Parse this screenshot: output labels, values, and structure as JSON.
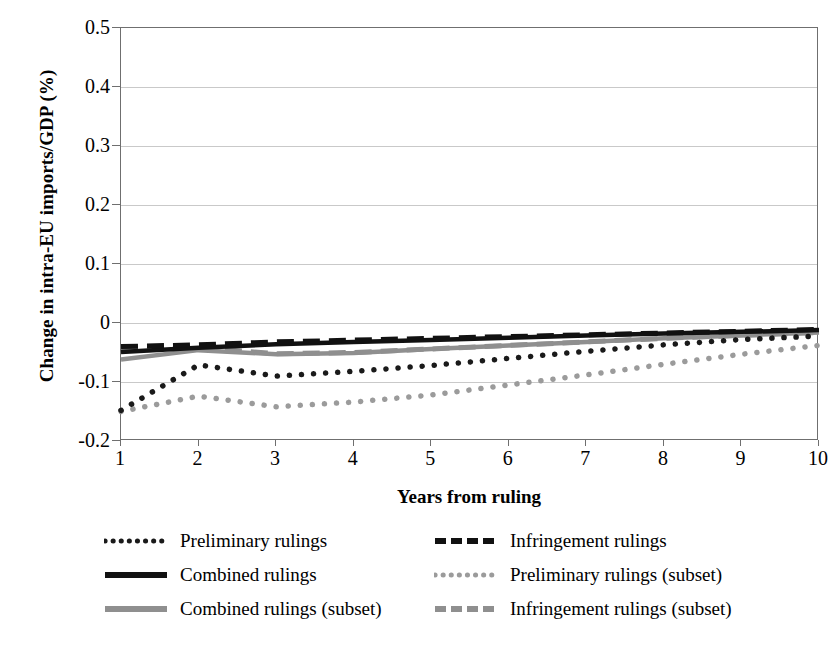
{
  "chart_data": {
    "type": "line",
    "title": "",
    "xlabel": "Years from ruling",
    "ylabel": "Change in intra-EU imports/GDP (%)",
    "x": [
      1,
      2,
      3,
      4,
      5,
      6,
      7,
      8,
      9,
      10
    ],
    "xtick_labels": [
      "1",
      "2",
      "3",
      "4",
      "5",
      "6",
      "7",
      "8",
      "9",
      "10"
    ],
    "ytick_labels": [
      "0.5",
      "0.4",
      "0.3",
      "0.2",
      "0.1",
      "0",
      "-0.1",
      "-0.2"
    ],
    "ytick_values": [
      0.5,
      0.4,
      0.3,
      0.2,
      0.1,
      0,
      -0.1,
      -0.2
    ],
    "xlim": [
      1,
      10
    ],
    "ylim": [
      -0.2,
      0.5
    ],
    "grid": "horizontal",
    "legend_position": "below-plot",
    "series": [
      {
        "name": "Preliminary rulings",
        "style": "dotted",
        "color": "#1a1a1a",
        "values": [
          -0.148,
          -0.071,
          -0.09,
          -0.082,
          -0.072,
          -0.06,
          -0.048,
          -0.037,
          -0.028,
          -0.022
        ]
      },
      {
        "name": "Infringement rulings",
        "style": "dashed",
        "color": "#111111",
        "values": [
          -0.04,
          -0.037,
          -0.032,
          -0.029,
          -0.026,
          -0.023,
          -0.02,
          -0.017,
          -0.014,
          -0.011
        ]
      },
      {
        "name": "Combined rulings",
        "style": "solid",
        "color": "#111111",
        "values": [
          -0.049,
          -0.042,
          -0.036,
          -0.032,
          -0.029,
          -0.025,
          -0.021,
          -0.018,
          -0.015,
          -0.012
        ]
      },
      {
        "name": "Preliminary rulings (subset)",
        "style": "dotted",
        "color": "#9b9b9b",
        "values": [
          -0.15,
          -0.124,
          -0.142,
          -0.134,
          -0.122,
          -0.105,
          -0.088,
          -0.07,
          -0.053,
          -0.038
        ]
      },
      {
        "name": "Combined rulings (subset)",
        "style": "solid",
        "color": "#8f8f8f",
        "values": [
          -0.062,
          -0.046,
          -0.053,
          -0.051,
          -0.044,
          -0.038,
          -0.032,
          -0.026,
          -0.021,
          -0.016
        ]
      },
      {
        "name": "Infringement rulings (subset)",
        "style": "dashed",
        "color": "#8f8f8f",
        "values": [
          -0.047,
          -0.042,
          -0.052,
          -0.05,
          -0.044,
          -0.038,
          -0.032,
          -0.026,
          -0.021,
          -0.016
        ]
      }
    ]
  },
  "legend": {
    "rows": [
      [
        {
          "name": "Preliminary rulings",
          "style": "dotted",
          "color": "#1a1a1a"
        },
        {
          "name": "Infringement rulings",
          "style": "dashed",
          "color": "#111111"
        }
      ],
      [
        {
          "name": "Combined rulings",
          "style": "solid",
          "color": "#111111"
        },
        {
          "name": "Preliminary rulings (subset)",
          "style": "dotted",
          "color": "#9b9b9b"
        }
      ],
      [
        {
          "name": "Combined rulings (subset)",
          "style": "solid",
          "color": "#8f8f8f"
        },
        {
          "name": "Infringement rulings (subset)",
          "style": "dashed",
          "color": "#8f8f8f"
        }
      ]
    ]
  },
  "colors": {
    "axis": "#6f6f6f",
    "grid": "#c9c9c9",
    "dark_series": "#111111",
    "gray_series": "#8f8f8f",
    "background": "#ffffff"
  }
}
